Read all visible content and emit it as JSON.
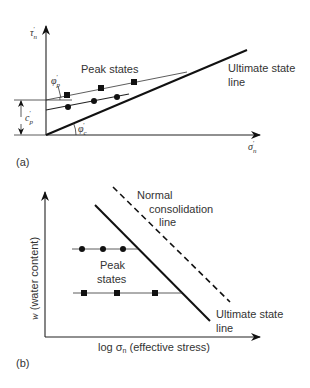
{
  "panel_a": {
    "label": "(a)",
    "y_axis": {
      "symbol": "τ",
      "sub": "n",
      "prime": "′"
    },
    "x_axis": {
      "symbol": "σ",
      "sub": "n",
      "prime": "′"
    },
    "peak_states_label": "Peak states",
    "ultimate_line_label_1": "Ultimate state",
    "ultimate_line_label_2": "line",
    "cohesion": {
      "symbol": "c",
      "sub": "p",
      "prime": "′"
    },
    "peak_angle": {
      "symbol": "φ",
      "sub": "p",
      "prime": "′"
    },
    "critical_angle": {
      "symbol": "φ",
      "sub": "c",
      "prime": "′"
    },
    "series": [
      {
        "name": "peak-squares",
        "marker": "square",
        "points": [
          [
            67,
            95
          ],
          [
            101,
            88
          ],
          [
            134,
            82
          ]
        ]
      },
      {
        "name": "peak-circles",
        "marker": "circle",
        "points": [
          [
            68,
            107
          ],
          [
            94,
            101
          ],
          [
            117,
            97
          ]
        ]
      }
    ]
  },
  "panel_b": {
    "label": "(b)",
    "y_axis_label_var": "w",
    "y_axis_label_rest": " (water content)",
    "x_axis_label_pre": "log σ",
    "x_axis_label_sub": "n",
    "x_axis_label_post": " (effective stress)",
    "ncl_label_1": "Normal",
    "ncl_label_2": "consolidation",
    "ncl_label_3": "line",
    "peak_states_label_1": "Peak",
    "peak_states_label_2": "states",
    "ultimate_line_label_1": "Ultimate state",
    "ultimate_line_label_2": "line",
    "series": [
      {
        "name": "peak-circles",
        "marker": "circle",
        "points": [
          [
            82,
            249
          ],
          [
            103,
            249
          ],
          [
            123,
            249
          ]
        ]
      },
      {
        "name": "peak-squares",
        "marker": "square",
        "points": [
          [
            84,
            293
          ],
          [
            117,
            293
          ],
          [
            155,
            293
          ]
        ]
      }
    ]
  }
}
